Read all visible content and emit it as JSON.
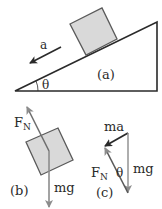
{
  "figure": {
    "panel_a": {
      "label": "(a)",
      "acceleration_label": "a",
      "angle_label": "θ"
    },
    "panel_b": {
      "label": "(b)",
      "normal_force_label": "F",
      "normal_force_sub": "N",
      "weight_label": "mg"
    },
    "panel_c": {
      "label": "(c)",
      "net_force_label": "ma",
      "normal_force_label": "F",
      "normal_force_sub": "N",
      "angle_label": "θ",
      "weight_label": "mg"
    },
    "colors": {
      "line": "#2a2a2a",
      "block_fill": "#d9d9d9",
      "block_stroke": "#5a5a5a",
      "vector_gray": "#8c8c8c"
    }
  }
}
